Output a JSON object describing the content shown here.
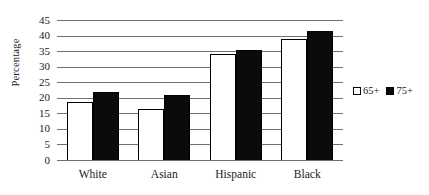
{
  "chart_data": {
    "type": "bar",
    "title": "",
    "subtitle": "",
    "xlabel": "",
    "ylabel": "Percentage",
    "categories": [
      "White",
      "Asian",
      "Hispanic",
      "Black"
    ],
    "series": [
      {
        "name": "65+",
        "color": "#ffffff",
        "values": [
          18.5,
          16.5,
          34.0,
          39.0
        ]
      },
      {
        "name": "75+",
        "color": "#0b0b0b",
        "values": [
          22.0,
          21.0,
          35.5,
          41.5
        ]
      }
    ],
    "ylim": [
      0,
      45
    ],
    "ytick_step": 5,
    "yticks": [
      0,
      5,
      10,
      15,
      20,
      25,
      30,
      35,
      40,
      45
    ],
    "ytick_labels": [
      "0",
      "5",
      "10",
      "15",
      "20",
      "25",
      "30",
      "35",
      "40",
      "45"
    ],
    "grid": true,
    "grid_axis": "y",
    "grid_color": "#6f6f6f",
    "legend_position": "right",
    "annotations": []
  },
  "legend": {
    "entries": [
      {
        "label": "65+",
        "swatch": "white-square-icon"
      },
      {
        "label": "75+",
        "swatch": "black-square-icon"
      }
    ]
  }
}
